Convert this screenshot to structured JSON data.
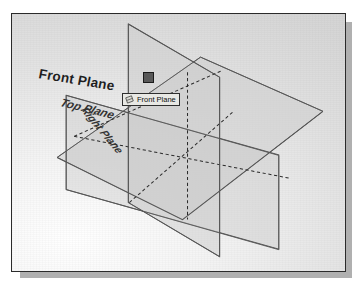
{
  "app": {
    "context": "cad-3d-viewport",
    "title": "Reference Planes"
  },
  "viewport": {
    "background_top_color": "#d2d2d2",
    "background_bottom_color": "#ffffff",
    "border_color": "#2b2b2b",
    "shadow_color": "#b0b0b0"
  },
  "labels": {
    "front_plane": "Front Plane",
    "top_plane": "Top Plane",
    "right_plane": "Right Plane"
  },
  "tooltip": {
    "text": "Front Plane",
    "icon": "plane-icon",
    "background_color": "#e8e8e4",
    "border_color": "#2e2e2e"
  },
  "cursor": {
    "type": "selection-handle",
    "shape": "square",
    "fill_color": "#585858",
    "border_color": "#1a1a1a"
  },
  "planes": [
    {
      "name": "Front Plane",
      "orientation": "vertical-frontal",
      "fill_color": "#cfcfcf",
      "edge_color": "#555555",
      "selected": true
    },
    {
      "name": "Top Plane",
      "orientation": "horizontal",
      "fill_color": "#cacaca",
      "edge_color": "#555555",
      "selected": false
    },
    {
      "name": "Right Plane",
      "orientation": "vertical-lateral",
      "fill_color": "#c9c9c9",
      "edge_color": "#555555",
      "selected": false
    }
  ],
  "edges": {
    "hidden_line_style": "dashed",
    "hidden_line_color": "#2a2a2a",
    "visible_line_color": "#555555"
  }
}
